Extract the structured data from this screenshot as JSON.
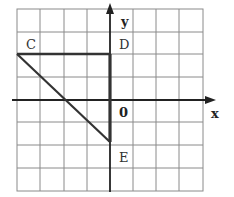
{
  "diagram": {
    "type": "coordinate-grid-figure",
    "grid": {
      "columns": 8,
      "rows": 8,
      "cell_px": 23,
      "origin_col": 4,
      "origin_row": 4,
      "line_color": "#888888"
    },
    "axes": {
      "x_label": "x",
      "y_label": "y",
      "origin_label": "0",
      "color": "#222222"
    },
    "points": [
      {
        "name": "C",
        "x": -4,
        "y": 2
      },
      {
        "name": "D",
        "x": 0,
        "y": 2
      },
      {
        "name": "E",
        "x": 0,
        "y": -2
      }
    ],
    "figure": {
      "shape": "triangle",
      "vertices": [
        "C",
        "D",
        "E"
      ],
      "stroke": "#333333"
    }
  }
}
